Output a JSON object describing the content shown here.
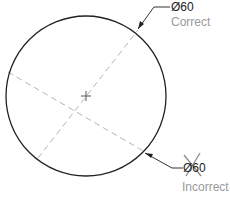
{
  "diagram": {
    "circle": {
      "cx": 86,
      "cy": 96,
      "r": 80,
      "stroke": "#222222"
    },
    "center_mark": {
      "x": 86,
      "y": 96
    },
    "centerline_color": "#b5b5b5",
    "correct": {
      "dimension_text": "Ø60",
      "label": "Correct"
    },
    "incorrect": {
      "dimension_text": "Ø60",
      "label": "Incorrect",
      "cross_color": "#8c8c8c"
    },
    "colors": {
      "line": "#222222",
      "note_text": "#9a9a9a",
      "background": "#ffffff"
    }
  }
}
